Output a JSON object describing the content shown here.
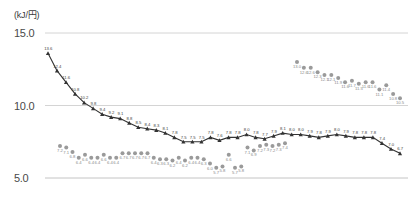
{
  "chart": {
    "axis_unit_label": "(kJ/円)",
    "y_ticks": [
      "15.0",
      "10.0",
      "5.0"
    ]
  },
  "chart_data": {
    "type": "line",
    "title": "",
    "subtitle": "",
    "xlabel": "",
    "ylabel": "(kJ/円)",
    "ylim": [
      5.0,
      15.0
    ],
    "y_ticks": [
      5.0,
      10.0,
      15.0
    ],
    "grid": true,
    "legend": "none",
    "series": [
      {
        "name": "dark-series",
        "color": "#333333",
        "marker": "triangle",
        "line": true,
        "values": [
          13.6,
          12.4,
          11.6,
          10.8,
          10.2,
          9.8,
          9.4,
          9.2,
          9.1,
          8.8,
          8.5,
          8.4,
          8.3,
          8.1,
          7.8,
          7.5,
          7.5,
          7.5,
          7.8,
          7.6,
          7.8,
          7.8,
          8.0,
          7.8,
          7.7,
          7.9,
          8.1,
          8.0,
          8.0,
          7.9,
          7.8,
          7.9,
          8.0,
          7.9,
          7.8,
          7.8,
          7.8,
          7.4,
          7.0,
          6.7
        ],
        "labels": [
          "13.6",
          "12.4",
          "11.6",
          "10.8",
          "10.2",
          "9.8",
          "9.4",
          "9.2",
          "9.1",
          "8.8",
          "8.5",
          "8.4",
          "8.3",
          "8.1",
          "7.8",
          "7.5",
          "7.5",
          "7.5",
          "7.8",
          "7.6",
          "7.8",
          "7.8",
          "8.0",
          "7.8",
          "7.7",
          "7.9",
          "8.1",
          "8.0",
          "8.0",
          "7.9",
          "7.8",
          "7.9",
          "8.0",
          "7.9",
          "7.8",
          "7.8",
          "7.8",
          "7.4",
          "7.0",
          "6.7"
        ]
      },
      {
        "name": "gray-series",
        "color": "#9a9a9a",
        "marker": "circle",
        "line": false,
        "values": [
          7.2,
          7.1,
          6.8,
          6.4,
          6.6,
          6.4,
          6.4,
          6.6,
          6.4,
          6.4,
          6.7,
          6.7,
          6.7,
          6.7,
          6.7,
          6.4,
          6.3,
          6.3,
          6.2,
          6.4,
          6.2,
          6.4,
          6.4,
          6.3,
          6.0,
          5.7,
          5.8,
          6.6,
          5.7,
          5.8,
          7.1,
          6.9,
          7.2,
          7.3,
          7.2,
          7.3,
          7.4,
          13.0,
          12.6,
          12.6,
          12.3,
          12.1,
          12.1,
          11.9,
          11.6,
          11.7,
          11.5,
          11.6,
          11.6,
          11.1,
          11.4,
          10.8,
          10.5
        ],
        "labels": [
          "7.2",
          "7.1",
          "6.8",
          "6.4",
          "6.6",
          "6.4",
          "6.4",
          "6.6",
          "6.4",
          "6.4",
          "6.7",
          "6.7",
          "6.7",
          "6.7",
          "6.7",
          "6.4",
          "6.3",
          "6.3",
          "6.2",
          "6.4",
          "6.2",
          "6.4",
          "6.4",
          "6.3",
          "6.0",
          "5.7",
          "5.8",
          "6.6",
          "5.7",
          "5.8",
          "7.1",
          "6.9",
          "7.2",
          "7.3",
          "7.2",
          "7.3",
          "7.4",
          "13.0",
          "12.6",
          "12.6",
          "12.3",
          "12.1",
          "12.1",
          "11.9",
          "11.6",
          "11.7",
          "11.5",
          "11.6",
          "11.6",
          "11.1",
          "11.4",
          "10.8",
          "10.5"
        ]
      }
    ]
  }
}
